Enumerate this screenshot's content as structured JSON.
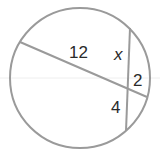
{
  "diagram": {
    "type": "intersecting-chords",
    "circle": {
      "cx": 80,
      "cy": 78,
      "r": 70
    },
    "chords": [
      {
        "name": "chord-a",
        "x1": 20,
        "y1": 42,
        "x2": 147,
        "y2": 97
      },
      {
        "name": "chord-b",
        "x1": 130,
        "y1": 28,
        "x2": 126,
        "y2": 131
      }
    ],
    "labels": {
      "segment_12": "12",
      "segment_x": "x",
      "segment_2": "2",
      "segment_4": "4"
    },
    "colors": {
      "stroke": "#9a9a9a",
      "text": "#2a2a2a"
    }
  }
}
